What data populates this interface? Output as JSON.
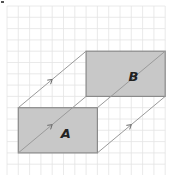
{
  "diagram": {
    "type": "translation-on-grid",
    "grid": {
      "origin_x": 7,
      "origin_y": 6,
      "cell": 11.3,
      "cols": 14,
      "rows": 15,
      "line_color": "#e4e4e4"
    },
    "shapes": [
      {
        "id": "A",
        "label": "A",
        "col": 1,
        "row": 9,
        "width_cells": 7,
        "height_cells": 4,
        "fill": "#c8c8c8",
        "stroke": "#8a8a8a"
      },
      {
        "id": "B",
        "label": "B",
        "col": 7,
        "row": 4,
        "width_cells": 7,
        "height_cells": 4,
        "fill": "#c8c8c8",
        "stroke": "#8a8a8a"
      }
    ],
    "translation": {
      "dx_cells": 6,
      "dy_cells": -5
    },
    "connector_color": "#9a9a9a",
    "label_color": "#222222"
  }
}
